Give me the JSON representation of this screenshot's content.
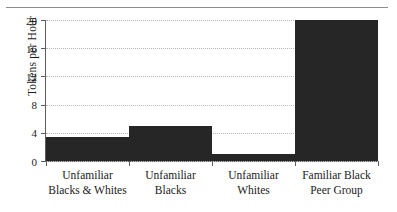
{
  "chart_data": {
    "type": "bar",
    "title": "",
    "xlabel": "",
    "ylabel": "Tokens per Hour",
    "ylim": [
      0,
      20
    ],
    "yticks": [
      0,
      4,
      8,
      12,
      16,
      20
    ],
    "grid": true,
    "legend": false,
    "bar_color": "#262626",
    "categories": [
      "Unfamiliar Blacks & Whites",
      "Unfamiliar Blacks",
      "Unfamiliar Whites",
      "Familiar Black Peer Group"
    ],
    "category_lines": [
      [
        "Unfamiliar",
        "Blacks & Whites"
      ],
      [
        "Unfamiliar",
        "Blacks"
      ],
      [
        "Unfamiliar",
        "Whites"
      ],
      [
        "Familiar Black",
        "Peer Group"
      ]
    ],
    "values": [
      3.4,
      5.0,
      1.0,
      20.0
    ]
  },
  "axis": {
    "ytick_labels": [
      "0",
      "4",
      "8",
      "12",
      "16",
      "20"
    ]
  }
}
